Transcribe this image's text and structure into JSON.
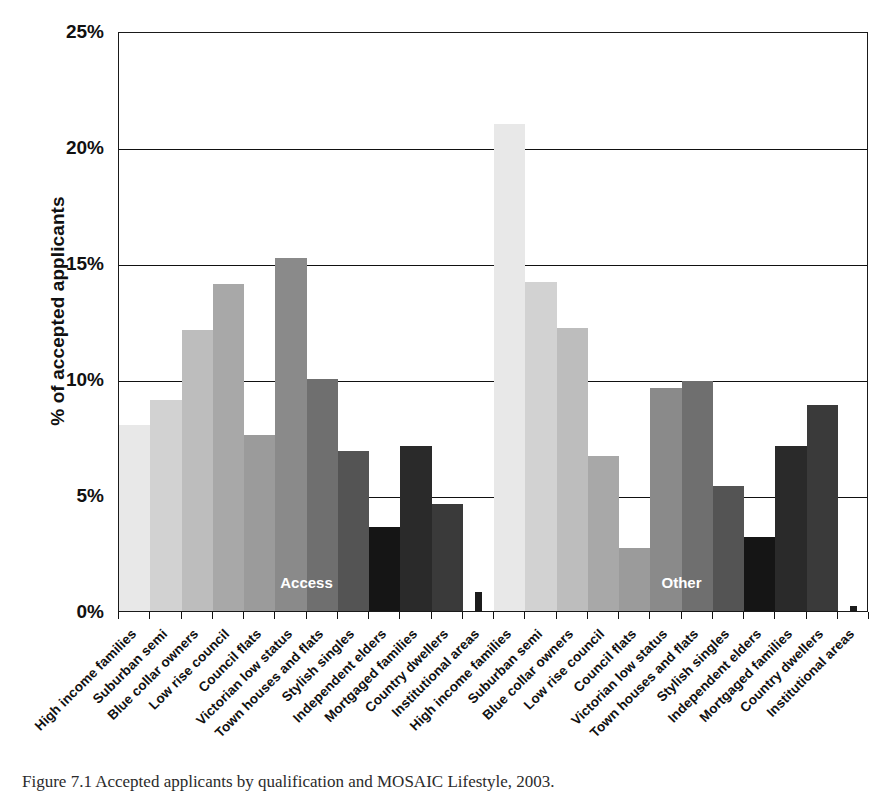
{
  "figure": {
    "caption": "Figure 7.1 Accepted applicants by qualification and MOSAIC Lifestyle, 2003."
  },
  "chart_data": {
    "type": "bar",
    "title": "",
    "subtitle": "",
    "xlabel": "",
    "ylabel": "% of accepted applicants",
    "ylim": [
      0,
      25
    ],
    "ytick_labels": [
      "0%",
      "5%",
      "10%",
      "15%",
      "20%",
      "25%"
    ],
    "ytick_values": [
      0,
      5,
      10,
      15,
      20,
      25
    ],
    "grid": "horizontal",
    "legend": "none",
    "annotations": [
      "Access",
      "Other"
    ],
    "categories": [
      "High income families",
      "Suburban semi",
      "Blue collar owners",
      "Low rise council",
      "Council flats",
      "Victorian low status",
      "Town houses and flats",
      "Stylish singles",
      "Independent elders",
      "Mortgaged families",
      "Country dwellers",
      "Institutional areas"
    ],
    "groups": [
      {
        "name": "Access",
        "label": "Access",
        "values": [
          8.0,
          9.1,
          12.1,
          14.1,
          7.6,
          15.2,
          10.0,
          6.9,
          3.6,
          7.1,
          4.6,
          0.8
        ]
      },
      {
        "name": "Other",
        "label": "Other",
        "values": [
          21.0,
          14.2,
          12.2,
          6.7,
          2.7,
          9.6,
          9.9,
          5.4,
          3.2,
          7.1,
          8.9,
          0.2
        ]
      }
    ],
    "bar_colors": [
      "#e8e8e8",
      "#d2d2d2",
      "#bdbdbd",
      "#a8a8a8",
      "#9b9b9b",
      "#8a8a8a",
      "#6f6f6f",
      "#545454",
      "#151515",
      "#2a2a2a",
      "#3a3a3a",
      "#1c1c1c"
    ],
    "x_axis_labels": [
      "High income families",
      "Suburban semi",
      "Blue collar owners",
      "Low rise council",
      "Council flats",
      "Victorian low status",
      "Town houses and flats",
      "Stylish singles",
      "Independent elders",
      "Mortgaged families",
      "Country dwellers",
      "Institutional areas",
      "High income families",
      "Suburban semi",
      "Blue collar owners",
      "Low rise council",
      "Council flats",
      "Victorian low status",
      "Town houses and flats",
      "Stylish singles",
      "Independent elders",
      "Mortgaged families",
      "Country dwellers",
      "Institutional areas"
    ]
  }
}
